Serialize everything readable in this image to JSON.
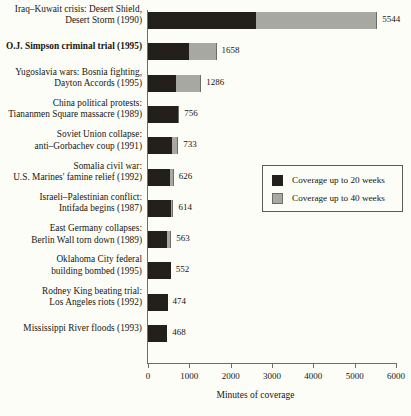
{
  "chart_data": {
    "type": "bar",
    "orientation": "horizontal",
    "stacked": true,
    "title": "",
    "xlabel": "Minutes of coverage",
    "ylabel": "",
    "xlim": [
      0,
      6000
    ],
    "xticks": [
      0,
      1000,
      2000,
      3000,
      4000,
      5000,
      6000
    ],
    "xtick_labels": [
      "0",
      "1000",
      "2000",
      "3000",
      "4000",
      "5000",
      "6000"
    ],
    "grid": false,
    "legend_position": "right-middle",
    "legend": [
      {
        "label": "Coverage up to 20 weeks",
        "color": "#231f1b",
        "key": "weeks20"
      },
      {
        "label": "Coverage up to 40 weeks",
        "color": "#a8a8a2",
        "key": "weeks40"
      }
    ],
    "categories": [
      "Iraq–Kuwait crisis: Desert Shield, Desert Storm (1990)",
      "O.J. Simpson criminal trial (1995)",
      "Yugoslavia wars: Bosnia fighting, Dayton Accords (1995)",
      "China political protests: Tiananmen Square massacre (1989)",
      "Soviet Union collapse: anti–Gorbachev coup (1991)",
      "Somalia civil war: U.S. Marines' famine relief (1992)",
      "Israeli–Palestinian conflict: Intifada begins (1987)",
      "East Germany collapses: Berlin Wall torn down (1989)",
      "Oklahoma City federal building bombed (1995)",
      "Rodney King beating trial: Los Angeles riots (1992)",
      "Mississippi River floods (1993)"
    ],
    "series": [
      {
        "name": "Coverage up to 20 weeks",
        "values": [
          2620,
          980,
          680,
          730,
          585,
          540,
          565,
          450,
          552,
          474,
          468
        ]
      },
      {
        "name": "Coverage up to 40 weeks",
        "values": [
          2924,
          678,
          606,
          26,
          148,
          86,
          49,
          113,
          0,
          0,
          0
        ]
      }
    ],
    "totals": [
      5544,
      1658,
      1286,
      756,
      733,
      626,
      614,
      563,
      552,
      474,
      468
    ],
    "value_labels": [
      "5544",
      "1658",
      "1286",
      "756",
      "733",
      "626",
      "614",
      "563",
      "552",
      "474",
      "468"
    ]
  },
  "rows": [
    {
      "label_lines": [
        "Iraq–Kuwait crisis: Desert Shield,",
        "Desert Storm (1990)"
      ],
      "bold": false,
      "value_label": "5544"
    },
    {
      "label_lines": [
        "O.J. Simpson criminal trial (1995)"
      ],
      "bold": true,
      "value_label": "1658"
    },
    {
      "label_lines": [
        "Yugoslavia wars: Bosnia fighting,",
        "Dayton Accords (1995)"
      ],
      "bold": false,
      "value_label": "1286"
    },
    {
      "label_lines": [
        "China political protests:",
        "Tiananmen Square massacre (1989)"
      ],
      "bold": false,
      "value_label": "756"
    },
    {
      "label_lines": [
        "Soviet Union collapse:",
        "anti–Gorbachev coup (1991)"
      ],
      "bold": false,
      "value_label": "733"
    },
    {
      "label_lines": [
        "Somalia civil war:",
        "U.S. Marines' famine relief (1992)"
      ],
      "bold": false,
      "value_label": "626"
    },
    {
      "label_lines": [
        "Israeli–Palestinian conflict:",
        "Intifada begins (1987)"
      ],
      "bold": false,
      "value_label": "614"
    },
    {
      "label_lines": [
        "East Germany collapses:",
        "Berlin Wall torn down (1989)"
      ],
      "bold": false,
      "value_label": "563"
    },
    {
      "label_lines": [
        "Oklahoma City federal",
        "building bombed (1995)"
      ],
      "bold": false,
      "value_label": "552"
    },
    {
      "label_lines": [
        "Rodney King beating trial:",
        "Los Angeles riots (1992)"
      ],
      "bold": false,
      "value_label": "474"
    },
    {
      "label_lines": [
        "Mississippi River floods (1993)"
      ],
      "bold": false,
      "value_label": "468"
    }
  ],
  "axis": {
    "x_title": "Minutes of coverage"
  }
}
